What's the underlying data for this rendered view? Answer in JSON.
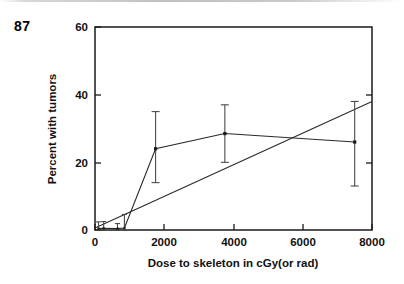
{
  "page": {
    "number": "87"
  },
  "chart_data": {
    "type": "line",
    "title": "",
    "xlabel": "Dose to skeleton in cGy(or rad)",
    "ylabel": "Percent with tumors",
    "xlim": [
      0,
      8000
    ],
    "ylim": [
      0,
      60
    ],
    "xticks": [
      0,
      2000,
      4000,
      6000,
      8000
    ],
    "yticks": [
      0,
      20,
      40,
      60
    ],
    "xtick_labels": [
      "0",
      "2000",
      "4000",
      "6000",
      "8000"
    ],
    "ytick_labels": [
      "0",
      "20",
      "40",
      "60"
    ],
    "grid": false,
    "legend": null,
    "series": [
      {
        "name": "Observed percent with tumors",
        "marker": "square",
        "x": [
          100,
          250,
          650,
          850,
          1750,
          3750,
          7500
        ],
        "values": [
          0.4,
          0.5,
          0.4,
          0.6,
          24.0,
          28.5,
          26.0
        ],
        "yerr_low": [
          0.4,
          0.5,
          0.4,
          0.6,
          10.0,
          8.5,
          13.0
        ],
        "yerr_high": [
          2.0,
          2.0,
          1.5,
          4.0,
          11.0,
          8.5,
          12.0
        ]
      },
      {
        "name": "Fitted linear dose-response",
        "marker": "none",
        "x": [
          0,
          8000
        ],
        "values": [
          0.6,
          38.0
        ]
      }
    ]
  }
}
